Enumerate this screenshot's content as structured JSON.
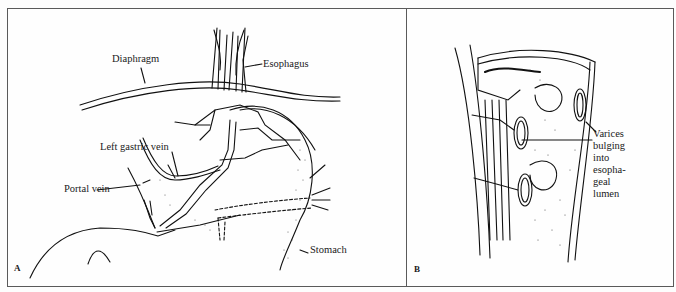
{
  "figure": {
    "panel_a": {
      "letter": "A",
      "labels": {
        "diaphragm": "Diaphragm",
        "esophagus": "Esophagus",
        "left_gastric_vein": "Left gastric vein",
        "portal_vein": "Portal vein",
        "stomach": "Stomach"
      }
    },
    "panel_b": {
      "letter": "B",
      "label_lines": [
        "Varices",
        "bulging",
        "into",
        "esopha-",
        "geal",
        "lumen"
      ]
    }
  }
}
